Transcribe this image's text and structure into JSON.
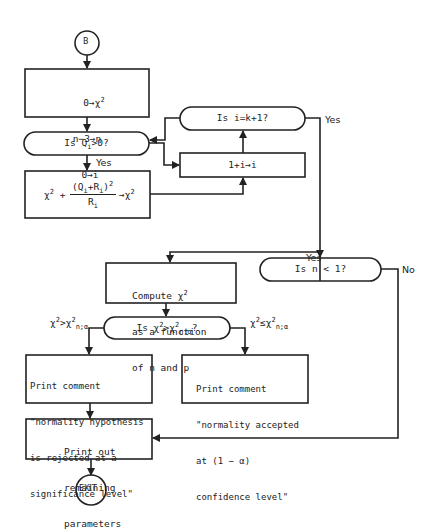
{
  "diagram": {
    "type": "flowchart",
    "nodes": {
      "start": {
        "label": "B"
      },
      "init": {
        "lines": [
          "0→χ²",
          "n−3→n",
          "0→i"
        ]
      },
      "check_q": {
        "label": "Is Qi>0?"
      },
      "accumulate": {
        "label": "χ² + (Qi+Ri)²/Ri → χ²"
      },
      "check_i": {
        "label": "Is i=k+1?"
      },
      "increment": {
        "label": "1+i→i"
      },
      "check_n": {
        "label": "Is n < 1?"
      },
      "compute": {
        "lines": [
          "Compute χ²",
          "as a function",
          "of n and p"
        ]
      },
      "compare": {
        "label": "Is χ²>χ²n;α?"
      },
      "reject": {
        "lines": [
          "Print comment",
          "\"normality hypothesis",
          "is rejected at a",
          "significance level\""
        ]
      },
      "accept": {
        "lines": [
          "Print comment",
          "\"normality accepted",
          "at (1 − α)",
          "confidence level\""
        ]
      },
      "printout": {
        "lines": [
          "Print out",
          "remaining",
          "parameters"
        ]
      },
      "exit": {
        "label": "EXIT"
      }
    },
    "edge_labels": {
      "q_yes": "Yes",
      "i_yes": "Yes",
      "n_yes": "Yes",
      "n_no": "No",
      "gt": "χ²>χ²n;α",
      "le": "χ²≤χ²n;α"
    },
    "colors": {
      "stroke": "#222222",
      "background": "#ffffff"
    }
  }
}
